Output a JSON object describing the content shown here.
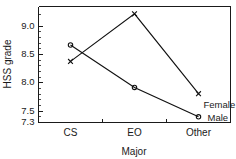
{
  "chart_data": {
    "type": "line",
    "title": "",
    "subtitle": "",
    "xlabel": "Major",
    "ylabel": "HSS grade",
    "categories": [
      "CS",
      "EO",
      "Other"
    ],
    "ylim": [
      7.3,
      9.35
    ],
    "xlim": [
      0,
      3
    ],
    "grid": false,
    "legend_position": "inline-right",
    "ytick_labels": [
      "9.0",
      "8.5",
      "8.0",
      "7.5",
      "7.3"
    ],
    "ytick_values": [
      9.0,
      8.5,
      8.0,
      7.5,
      7.3
    ],
    "yminor_tick_values": [
      9.2,
      8.9,
      8.8,
      8.7,
      8.6,
      8.4,
      8.3,
      8.2,
      8.1,
      7.9,
      7.8,
      7.7,
      7.6,
      7.4
    ],
    "series": [
      {
        "name": "Female",
        "marker": "x",
        "values": [
          8.38,
          9.22,
          7.81
        ]
      },
      {
        "name": "Male",
        "marker": "circle",
        "values": [
          8.67,
          7.92,
          7.4
        ]
      }
    ],
    "annotations": [
      {
        "text": "Female",
        "series": "Female"
      },
      {
        "text": "Male",
        "series": "Male"
      }
    ]
  },
  "figure": {
    "background_color": "#ffffff",
    "ink_color": "#111111"
  }
}
